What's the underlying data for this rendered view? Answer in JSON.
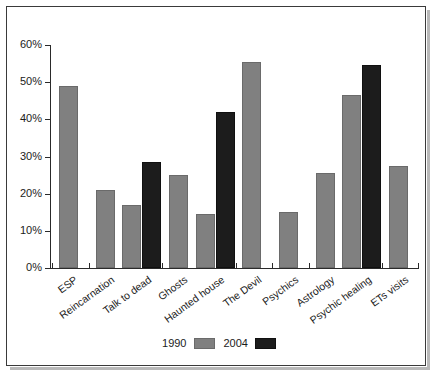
{
  "chart_data": {
    "type": "bar",
    "title": "",
    "subtitle": "",
    "xlabel": "",
    "ylabel": "",
    "ylim": [
      0,
      60
    ],
    "yticks": [
      0,
      10,
      20,
      30,
      40,
      50,
      60
    ],
    "ytick_labels": [
      "0%",
      "10%",
      "20%",
      "30%",
      "40%",
      "50%",
      "60%"
    ],
    "grid": false,
    "legend_position": "bottom-center",
    "categories": [
      "ESP",
      "Reincarnation",
      "Talk to dead",
      "Ghosts",
      "Haunted house",
      "The Devil",
      "Psychics",
      "Astrology",
      "Psychic healing",
      "ETs visits"
    ],
    "series": [
      {
        "name": "1990",
        "color": "#808080",
        "values": [
          49,
          21,
          17,
          25,
          14.5,
          55.5,
          15,
          25.5,
          46.5,
          27.5
        ]
      },
      {
        "name": "2004",
        "color": "#1c1c1c",
        "values": [
          null,
          null,
          28.5,
          null,
          42,
          null,
          null,
          null,
          54.5,
          null
        ]
      }
    ]
  },
  "legend": {
    "items": [
      {
        "label": "1990",
        "swatch": "gray-swatch"
      },
      {
        "label": "2004",
        "swatch": "black-swatch"
      }
    ]
  }
}
